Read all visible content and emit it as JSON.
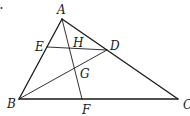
{
  "diagram": {
    "type": "geometry-triangle",
    "points": {
      "A": {
        "label": "A",
        "x": 62,
        "y": 19,
        "lx": 57,
        "ly": 14
      },
      "B": {
        "label": "B",
        "x": 19,
        "y": 99,
        "lx": 7,
        "ly": 108
      },
      "C": {
        "label": "C",
        "x": 178,
        "y": 99,
        "lx": 183,
        "ly": 109
      },
      "D": {
        "label": "D",
        "x": 107,
        "y": 50,
        "lx": 110,
        "ly": 50
      },
      "E": {
        "label": "E",
        "x": 47,
        "y": 47,
        "lx": 35,
        "ly": 51
      },
      "F": {
        "label": "F",
        "x": 82,
        "y": 99,
        "lx": 82,
        "ly": 114
      },
      "G": {
        "label": "G",
        "x": 74,
        "y": 68,
        "lx": 80,
        "ly": 78
      },
      "H": {
        "label": "H",
        "x": 70,
        "y": 48,
        "lx": 73,
        "ly": 47
      }
    },
    "segments": [
      {
        "from": "A",
        "to": "B",
        "style": "edge"
      },
      {
        "from": "B",
        "to": "C",
        "style": "edge"
      },
      {
        "from": "A",
        "to": "C",
        "style": "edge"
      },
      {
        "from": "E",
        "to": "D",
        "style": "inner"
      },
      {
        "from": "B",
        "to": "D",
        "style": "inner"
      },
      {
        "from": "A",
        "to": "F",
        "style": "inner"
      }
    ],
    "stray_mark": {
      "x": 1.5,
      "y": 8
    }
  }
}
